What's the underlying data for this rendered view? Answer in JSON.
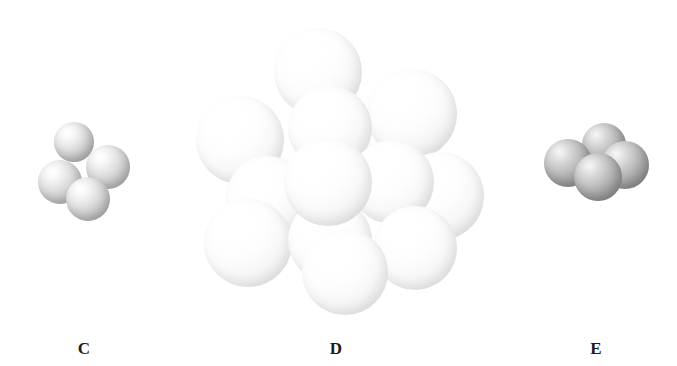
{
  "figure": {
    "background_color": "#ffffff",
    "label_color": "#1c1c1c",
    "panels": [
      {
        "id": "C",
        "label": "C",
        "label_x": 84,
        "label_y": 340,
        "sphere_tone": "lightgray",
        "sphere_color": "#cdcdcd",
        "sphere_count": 4,
        "arrangement": "tetrahedral",
        "spheres": [
          {
            "name": "sphere-top",
            "cx": 74,
            "cy": 142,
            "r": 20,
            "z": 2
          },
          {
            "name": "sphere-right",
            "cx": 108,
            "cy": 167,
            "r": 22,
            "z": 3
          },
          {
            "name": "sphere-left-front",
            "cx": 60,
            "cy": 182,
            "r": 22,
            "z": 4
          },
          {
            "name": "sphere-bottom-front",
            "cx": 88,
            "cy": 199,
            "r": 22,
            "z": 5
          }
        ]
      },
      {
        "id": "D",
        "label": "D",
        "label_x": 336,
        "label_y": 340,
        "sphere_tone": "white",
        "sphere_color": "#f6f6f6",
        "sphere_count": 13,
        "arrangement": "close-packed cluster",
        "spheres": [
          {
            "name": "sphere-top",
            "cx": 318,
            "cy": 72,
            "r": 44,
            "z": 2
          },
          {
            "name": "sphere-upper-right",
            "cx": 412,
            "cy": 114,
            "r": 45,
            "z": 2
          },
          {
            "name": "sphere-upper-center",
            "cx": 330,
            "cy": 128,
            "r": 42,
            "z": 3
          },
          {
            "name": "sphere-left",
            "cx": 240,
            "cy": 140,
            "r": 44,
            "z": 3
          },
          {
            "name": "sphere-right",
            "cx": 440,
            "cy": 196,
            "r": 44,
            "z": 4
          },
          {
            "name": "sphere-mid-right",
            "cx": 392,
            "cy": 182,
            "r": 42,
            "z": 5
          },
          {
            "name": "sphere-mid-left",
            "cx": 268,
            "cy": 198,
            "r": 42,
            "z": 5
          },
          {
            "name": "sphere-center-front",
            "cx": 328,
            "cy": 182,
            "r": 44,
            "z": 7
          },
          {
            "name": "sphere-lower-left",
            "cx": 248,
            "cy": 243,
            "r": 44,
            "z": 6
          },
          {
            "name": "sphere-lower-right",
            "cx": 415,
            "cy": 248,
            "r": 42,
            "z": 6
          },
          {
            "name": "sphere-lower-center",
            "cx": 330,
            "cy": 240,
            "r": 42,
            "z": 6
          },
          {
            "name": "sphere-bottom-front",
            "cx": 345,
            "cy": 272,
            "r": 43,
            "z": 8
          },
          {
            "name": "sphere-back-right",
            "cx": 392,
            "cy": 128,
            "r": 38,
            "z": 1
          }
        ]
      },
      {
        "id": "E",
        "label": "E",
        "label_x": 596,
        "label_y": 340,
        "sphere_tone": "midgray",
        "sphere_color": "#a8a8a8",
        "sphere_count": 4,
        "arrangement": "tetrahedral",
        "spheres": [
          {
            "name": "sphere-back-top",
            "cx": 604,
            "cy": 145,
            "r": 22,
            "z": 2
          },
          {
            "name": "sphere-left",
            "cx": 568,
            "cy": 163,
            "r": 24,
            "z": 3
          },
          {
            "name": "sphere-right",
            "cx": 625,
            "cy": 165,
            "r": 24,
            "z": 3
          },
          {
            "name": "sphere-center-front",
            "cx": 598,
            "cy": 177,
            "r": 24,
            "z": 5
          }
        ]
      }
    ]
  }
}
